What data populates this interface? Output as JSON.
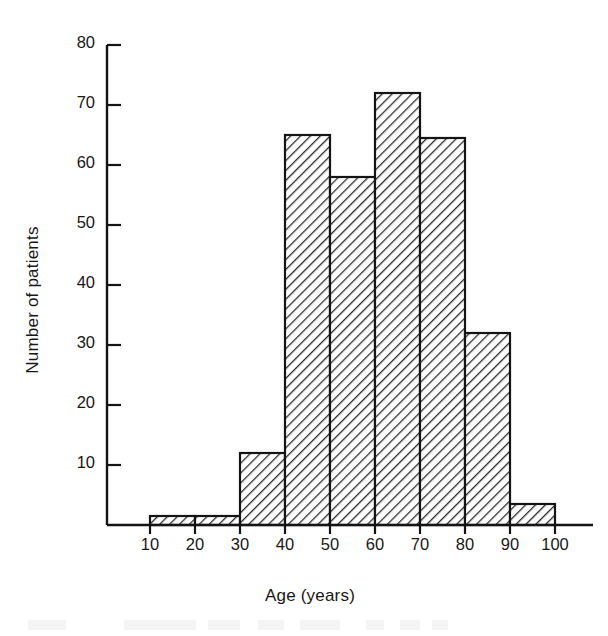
{
  "figure": {
    "background_color": "#ffffff",
    "ink_color": "#181818",
    "bar_fill": "hatch-diagonal-45",
    "bar_outline_color": "#141414"
  },
  "chart_data": {
    "type": "bar",
    "title": "",
    "subtitle": "",
    "xlabel": "Age (years)",
    "ylabel": "Number of patients",
    "grid": false,
    "legend": null,
    "legend_position": "none",
    "xlim": [
      5,
      102
    ],
    "ylim": [
      0,
      82
    ],
    "x_ticks": [
      10,
      20,
      30,
      40,
      50,
      60,
      70,
      80,
      90,
      100
    ],
    "x_tick_labels": [
      "10",
      "20",
      "30",
      "40",
      "50",
      "60",
      "70",
      "80",
      "90",
      "100"
    ],
    "y_ticks": [
      10,
      20,
      30,
      40,
      50,
      60,
      70,
      80
    ],
    "y_tick_labels": [
      "10",
      "20",
      "30",
      "40",
      "50",
      "60",
      "70",
      "80"
    ],
    "bin_width": 10,
    "categories": [
      "10-20",
      "20-30",
      "30-40",
      "40-50",
      "50-60",
      "60-70",
      "70-80",
      "80-90",
      "90-100"
    ],
    "bin_edges": [
      10,
      20,
      30,
      40,
      50,
      60,
      70,
      80,
      90,
      100
    ],
    "values": [
      1.5,
      1.5,
      12,
      65,
      58,
      72,
      64.5,
      32,
      3.5
    ],
    "series": [
      {
        "name": "Number of patients",
        "values": [
          1.5,
          1.5,
          12,
          65,
          58,
          72,
          64.5,
          32,
          3.5
        ]
      }
    ]
  }
}
